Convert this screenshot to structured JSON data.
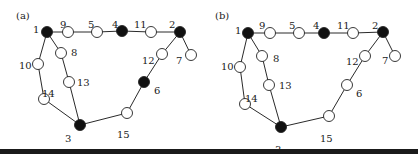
{
  "figure": {
    "colors": {
      "filled": "#111111",
      "empty": "#ffffff",
      "edge": "#2a2a2a",
      "text": "#1a1a1a"
    },
    "panels": [
      {
        "id": "a",
        "label": "(a)",
        "offset_x": 0,
        "nodes": [
          {
            "id": "1",
            "x": 47,
            "y": 32,
            "filled": true,
            "lx": 33,
            "ly": 25
          },
          {
            "id": "9",
            "x": 68,
            "y": 32,
            "filled": false,
            "lx": 60,
            "ly": 20
          },
          {
            "id": "5",
            "x": 97,
            "y": 32,
            "filled": false,
            "lx": 88,
            "ly": 20
          },
          {
            "id": "4",
            "x": 122,
            "y": 31,
            "filled": true,
            "lx": 112,
            "ly": 20
          },
          {
            "id": "11",
            "x": 151,
            "y": 32,
            "filled": false,
            "lx": 134,
            "ly": 20
          },
          {
            "id": "2",
            "x": 180,
            "y": 32,
            "filled": true,
            "lx": 169,
            "ly": 20
          },
          {
            "id": "7",
            "x": 191,
            "y": 55,
            "filled": false,
            "lx": 176,
            "ly": 56
          },
          {
            "id": "12",
            "x": 162,
            "y": 54,
            "filled": false,
            "lx": 142,
            "ly": 56
          },
          {
            "id": "8",
            "x": 61,
            "y": 53,
            "filled": false,
            "lx": 71,
            "ly": 48
          },
          {
            "id": "10",
            "x": 38,
            "y": 64,
            "filled": false,
            "lx": 19,
            "ly": 61
          },
          {
            "id": "13",
            "x": 69,
            "y": 82,
            "filled": false,
            "lx": 77,
            "ly": 78
          },
          {
            "id": "14",
            "x": 44,
            "y": 99,
            "filled": false,
            "lx": 42,
            "ly": 89
          },
          {
            "id": "3",
            "x": 80,
            "y": 125,
            "filled": true,
            "lx": 65,
            "ly": 134
          },
          {
            "id": "15",
            "x": 127,
            "y": 113,
            "filled": false,
            "lx": 117,
            "ly": 130
          },
          {
            "id": "6",
            "x": 144,
            "y": 82,
            "filled": true,
            "lx": 154,
            "ly": 86
          }
        ],
        "edges": [
          [
            "1",
            "9"
          ],
          [
            "9",
            "5"
          ],
          [
            "5",
            "4"
          ],
          [
            "4",
            "11"
          ],
          [
            "11",
            "2"
          ],
          [
            "2",
            "7"
          ],
          [
            "2",
            "12"
          ],
          [
            "12",
            "6"
          ],
          [
            "6",
            "15"
          ],
          [
            "15",
            "3"
          ],
          [
            "1",
            "8"
          ],
          [
            "8",
            "13"
          ],
          [
            "13",
            "3"
          ],
          [
            "1",
            "10"
          ],
          [
            "10",
            "14"
          ],
          [
            "14",
            "3"
          ]
        ]
      },
      {
        "id": "b",
        "label": "(b)",
        "offset_x": 0,
        "nodes": [
          {
            "id": "1",
            "x": 248,
            "y": 33,
            "filled": true,
            "lx": 235,
            "ly": 26
          },
          {
            "id": "9",
            "x": 270,
            "y": 33,
            "filled": false,
            "lx": 259,
            "ly": 21
          },
          {
            "id": "5",
            "x": 299,
            "y": 33,
            "filled": false,
            "lx": 289,
            "ly": 21
          },
          {
            "id": "4",
            "x": 324,
            "y": 33,
            "filled": true,
            "lx": 313,
            "ly": 21
          },
          {
            "id": "11",
            "x": 353,
            "y": 33,
            "filled": false,
            "lx": 337,
            "ly": 21
          },
          {
            "id": "2",
            "x": 383,
            "y": 32,
            "filled": true,
            "lx": 372,
            "ly": 21
          },
          {
            "id": "7",
            "x": 395,
            "y": 56,
            "filled": false,
            "lx": 382,
            "ly": 56
          },
          {
            "id": "12",
            "x": 365,
            "y": 56,
            "filled": false,
            "lx": 346,
            "ly": 57
          },
          {
            "id": "8",
            "x": 262,
            "y": 56,
            "filled": false,
            "lx": 273,
            "ly": 54
          },
          {
            "id": "10",
            "x": 240,
            "y": 67,
            "filled": false,
            "lx": 221,
            "ly": 62
          },
          {
            "id": "13",
            "x": 269,
            "y": 85,
            "filled": false,
            "lx": 279,
            "ly": 81
          },
          {
            "id": "14",
            "x": 245,
            "y": 104,
            "filled": false,
            "lx": 245,
            "ly": 94
          },
          {
            "id": "3",
            "x": 281,
            "y": 127,
            "filled": true,
            "lx": 275,
            "ly": 145
          },
          {
            "id": "15",
            "x": 329,
            "y": 116,
            "filled": false,
            "lx": 320,
            "ly": 134
          },
          {
            "id": "6",
            "x": 347,
            "y": 85,
            "filled": false,
            "lx": 356,
            "ly": 89
          }
        ],
        "edges": [
          [
            "1",
            "9"
          ],
          [
            "9",
            "5"
          ],
          [
            "5",
            "4"
          ],
          [
            "4",
            "11"
          ],
          [
            "11",
            "2"
          ],
          [
            "2",
            "7"
          ],
          [
            "2",
            "12"
          ],
          [
            "12",
            "6"
          ],
          [
            "6",
            "15"
          ],
          [
            "15",
            "3"
          ],
          [
            "1",
            "8"
          ],
          [
            "8",
            "13"
          ],
          [
            "13",
            "3"
          ],
          [
            "1",
            "10"
          ],
          [
            "10",
            "14"
          ],
          [
            "14",
            "3"
          ]
        ]
      }
    ],
    "panel_labels": [
      {
        "text": "(a)",
        "x": 16,
        "y": 19
      },
      {
        "text": "(b)",
        "x": 215,
        "y": 19
      }
    ]
  }
}
